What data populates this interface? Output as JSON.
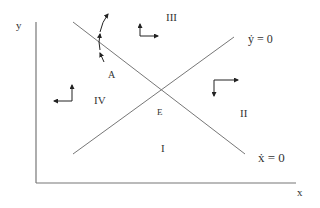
{
  "diagram": {
    "type": "phase_diagram",
    "axes": {
      "x_label": "x",
      "y_label": "y"
    },
    "isoclines": [
      {
        "label": "ẏ = 0",
        "slope": "upward"
      },
      {
        "label": "ẋ = 0",
        "slope": "downward"
      }
    ],
    "equilibrium_label": "E",
    "regions": [
      {
        "id": "I",
        "label": "I"
      },
      {
        "id": "II",
        "label": "II"
      },
      {
        "id": "III",
        "label": "III"
      },
      {
        "id": "IV",
        "label": "IV"
      }
    ],
    "point_label": "A",
    "colors": {
      "line": "#777777",
      "arrow": "#222222",
      "text": "#333333"
    }
  }
}
